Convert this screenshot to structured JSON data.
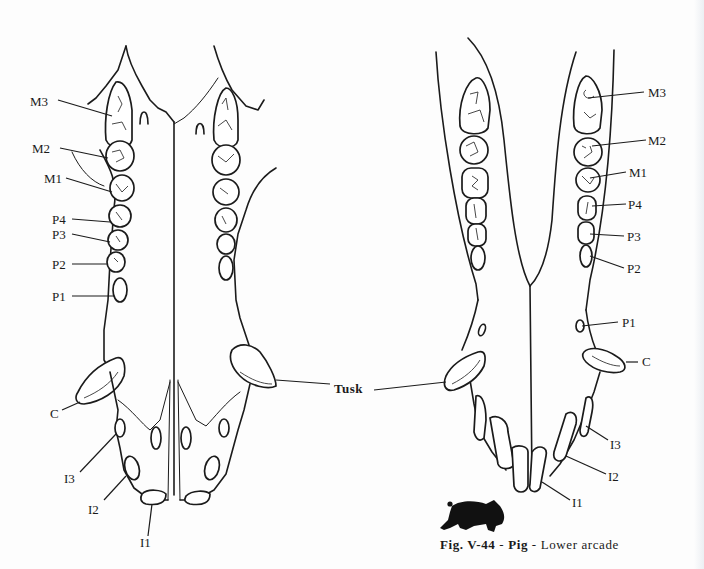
{
  "figure": {
    "number": "Fig. V-44",
    "separator": "-",
    "animal": "Pig",
    "view": "Lower arcade",
    "icon": "pig-silhouette-icon"
  },
  "upper_arcade": {
    "labels": [
      {
        "id": "M3",
        "text": "M3"
      },
      {
        "id": "M2",
        "text": "M2"
      },
      {
        "id": "M1",
        "text": "M1"
      },
      {
        "id": "P4",
        "text": "P4"
      },
      {
        "id": "P3",
        "text": "P3"
      },
      {
        "id": "P2",
        "text": "P2"
      },
      {
        "id": "P1",
        "text": "P1"
      },
      {
        "id": "C",
        "text": "C"
      },
      {
        "id": "I3",
        "text": "I3"
      },
      {
        "id": "I2",
        "text": "I2"
      },
      {
        "id": "I1",
        "text": "I1"
      }
    ]
  },
  "lower_arcade": {
    "labels": [
      {
        "id": "M3",
        "text": "M3"
      },
      {
        "id": "M2",
        "text": "M2"
      },
      {
        "id": "M1",
        "text": "M1"
      },
      {
        "id": "P4",
        "text": "P4"
      },
      {
        "id": "P3",
        "text": "P3"
      },
      {
        "id": "P2",
        "text": "P2"
      },
      {
        "id": "P1",
        "text": "P1"
      },
      {
        "id": "C",
        "text": "C"
      },
      {
        "id": "I3",
        "text": "I3"
      },
      {
        "id": "I2",
        "text": "I2"
      },
      {
        "id": "I1",
        "text": "I1"
      }
    ]
  },
  "shared_label": {
    "text": "Tusk"
  }
}
